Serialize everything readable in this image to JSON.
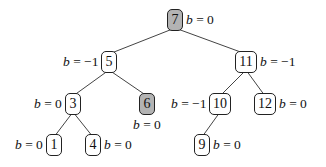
{
  "diagram": {
    "type": "binary-search-tree",
    "nodes": [
      {
        "id": "7",
        "key": "7",
        "balance": "b = 0",
        "highlighted": true,
        "x": 175,
        "y": 20,
        "w": 16,
        "label_side": "right"
      },
      {
        "id": "5",
        "key": "5",
        "balance": "b = −1",
        "highlighted": false,
        "x": 109,
        "y": 62,
        "w": 16,
        "label_side": "left"
      },
      {
        "id": "11",
        "key": "11",
        "balance": "b = −1",
        "highlighted": false,
        "x": 246,
        "y": 62,
        "w": 22,
        "label_side": "right"
      },
      {
        "id": "3",
        "key": "3",
        "balance": "b = 0",
        "highlighted": false,
        "x": 73,
        "y": 104,
        "w": 16,
        "label_side": "left"
      },
      {
        "id": "6",
        "key": "6",
        "balance": "b = 0",
        "highlighted": true,
        "x": 147,
        "y": 104,
        "w": 16,
        "label_side": "below"
      },
      {
        "id": "10",
        "key": "10",
        "balance": "b = −1",
        "highlighted": false,
        "x": 220,
        "y": 104,
        "w": 22,
        "label_side": "left"
      },
      {
        "id": "12",
        "key": "12",
        "balance": "b = 0",
        "highlighted": false,
        "x": 265,
        "y": 104,
        "w": 22,
        "label_side": "right"
      },
      {
        "id": "1",
        "key": "1",
        "balance": "b = 0",
        "highlighted": false,
        "x": 54,
        "y": 145,
        "w": 16,
        "label_side": "left"
      },
      {
        "id": "4",
        "key": "4",
        "balance": "b = 0",
        "highlighted": false,
        "x": 93,
        "y": 145,
        "w": 16,
        "label_side": "right"
      },
      {
        "id": "9",
        "key": "9",
        "balance": "b = 0",
        "highlighted": false,
        "x": 202,
        "y": 145,
        "w": 16,
        "label_side": "right"
      }
    ],
    "edges": [
      [
        "7",
        "5"
      ],
      [
        "7",
        "11"
      ],
      [
        "5",
        "3"
      ],
      [
        "5",
        "6"
      ],
      [
        "11",
        "10"
      ],
      [
        "11",
        "12"
      ],
      [
        "3",
        "1"
      ],
      [
        "3",
        "4"
      ],
      [
        "10",
        "9"
      ]
    ]
  }
}
